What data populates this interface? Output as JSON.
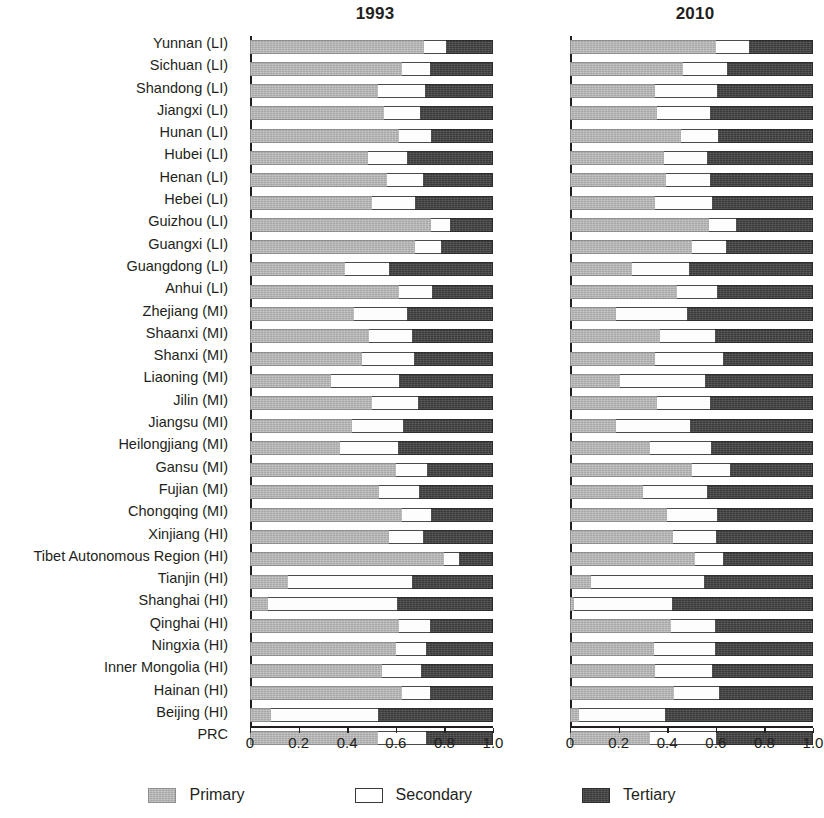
{
  "chart_data": {
    "type": "bar",
    "subtype": "stacked-horizontal-100pct",
    "panels": [
      {
        "title": "1993"
      },
      {
        "title": "2010"
      }
    ],
    "series": [
      {
        "name": "Primary",
        "color": "#a8a8a8"
      },
      {
        "name": "Secondary",
        "color": "#ffffff"
      },
      {
        "name": "Tertiary",
        "color": "#3a3a3a"
      }
    ],
    "categories": [
      "Yunnan (LI)",
      "Sichuan (LI)",
      "Shandong (LI)",
      "Jiangxi (LI)",
      "Hunan (LI)",
      "Hubei (LI)",
      "Henan (LI)",
      "Hebei (LI)",
      "Guizhou (LI)",
      "Guangxi (LI)",
      "Guangdong (LI)",
      "Anhui (LI)",
      "Zhejiang (MI)",
      "Shaanxi (MI)",
      "Shanxi (MI)",
      "Liaoning (MI)",
      "Jilin (MI)",
      "Jiangsu (MI)",
      "Heilongjiang (MI)",
      "Gansu (MI)",
      "Fujian (MI)",
      "Chongqing (MI)",
      "Xinjiang (HI)",
      "Tibet Autonomous Region (HI)",
      "Tianjin (HI)",
      "Shanghai (HI)",
      "Qinghai (HI)",
      "Ningxia (HI)",
      "Inner Mongolia (HI)",
      "Hainan (HI)",
      "Beijing (HI)",
      "PRC"
    ],
    "values_1993": [
      {
        "primary": 0.715,
        "secondary": 0.09,
        "tertiary": 0.195
      },
      {
        "primary": 0.625,
        "secondary": 0.115,
        "tertiary": 0.26
      },
      {
        "primary": 0.525,
        "secondary": 0.195,
        "tertiary": 0.28
      },
      {
        "primary": 0.55,
        "secondary": 0.15,
        "tertiary": 0.3
      },
      {
        "primary": 0.615,
        "secondary": 0.13,
        "tertiary": 0.255
      },
      {
        "primary": 0.485,
        "secondary": 0.16,
        "tertiary": 0.355
      },
      {
        "primary": 0.565,
        "secondary": 0.145,
        "tertiary": 0.29
      },
      {
        "primary": 0.5,
        "secondary": 0.18,
        "tertiary": 0.32
      },
      {
        "primary": 0.745,
        "secondary": 0.08,
        "tertiary": 0.175
      },
      {
        "primary": 0.68,
        "secondary": 0.105,
        "tertiary": 0.215
      },
      {
        "primary": 0.39,
        "secondary": 0.18,
        "tertiary": 0.43
      },
      {
        "primary": 0.615,
        "secondary": 0.135,
        "tertiary": 0.25
      },
      {
        "primary": 0.43,
        "secondary": 0.215,
        "tertiary": 0.355
      },
      {
        "primary": 0.49,
        "secondary": 0.175,
        "tertiary": 0.335
      },
      {
        "primary": 0.46,
        "secondary": 0.215,
        "tertiary": 0.325
      },
      {
        "primary": 0.335,
        "secondary": 0.28,
        "tertiary": 0.385
      },
      {
        "primary": 0.5,
        "secondary": 0.19,
        "tertiary": 0.31
      },
      {
        "primary": 0.42,
        "secondary": 0.21,
        "tertiary": 0.37
      },
      {
        "primary": 0.37,
        "secondary": 0.24,
        "tertiary": 0.39
      },
      {
        "primary": 0.6,
        "secondary": 0.13,
        "tertiary": 0.27
      },
      {
        "primary": 0.53,
        "secondary": 0.165,
        "tertiary": 0.305
      },
      {
        "primary": 0.625,
        "secondary": 0.12,
        "tertiary": 0.255
      },
      {
        "primary": 0.57,
        "secondary": 0.14,
        "tertiary": 0.29
      },
      {
        "primary": 0.8,
        "secondary": 0.06,
        "tertiary": 0.14
      },
      {
        "primary": 0.155,
        "secondary": 0.51,
        "tertiary": 0.335
      },
      {
        "primary": 0.075,
        "secondary": 0.53,
        "tertiary": 0.395
      },
      {
        "primary": 0.615,
        "secondary": 0.125,
        "tertiary": 0.26
      },
      {
        "primary": 0.6,
        "secondary": 0.125,
        "tertiary": 0.275
      },
      {
        "primary": 0.545,
        "secondary": 0.16,
        "tertiary": 0.295
      },
      {
        "primary": 0.625,
        "secondary": 0.115,
        "tertiary": 0.26
      },
      {
        "primary": 0.085,
        "secondary": 0.44,
        "tertiary": 0.475
      },
      {
        "primary": 0.525,
        "secondary": 0.2,
        "tertiary": 0.275
      }
    ],
    "values_2010": [
      {
        "primary": 0.6,
        "secondary": 0.135,
        "tertiary": 0.265
      },
      {
        "primary": 0.465,
        "secondary": 0.18,
        "tertiary": 0.355
      },
      {
        "primary": 0.35,
        "secondary": 0.255,
        "tertiary": 0.395
      },
      {
        "primary": 0.36,
        "secondary": 0.215,
        "tertiary": 0.425
      },
      {
        "primary": 0.455,
        "secondary": 0.155,
        "tertiary": 0.39
      },
      {
        "primary": 0.385,
        "secondary": 0.18,
        "tertiary": 0.435
      },
      {
        "primary": 0.395,
        "secondary": 0.18,
        "tertiary": 0.425
      },
      {
        "primary": 0.35,
        "secondary": 0.235,
        "tertiary": 0.415
      },
      {
        "primary": 0.57,
        "secondary": 0.115,
        "tertiary": 0.315
      },
      {
        "primary": 0.5,
        "secondary": 0.14,
        "tertiary": 0.36
      },
      {
        "primary": 0.255,
        "secondary": 0.235,
        "tertiary": 0.51
      },
      {
        "primary": 0.44,
        "secondary": 0.165,
        "tertiary": 0.395
      },
      {
        "primary": 0.19,
        "secondary": 0.29,
        "tertiary": 0.52
      },
      {
        "primary": 0.37,
        "secondary": 0.225,
        "tertiary": 0.405
      },
      {
        "primary": 0.35,
        "secondary": 0.28,
        "tertiary": 0.37
      },
      {
        "primary": 0.205,
        "secondary": 0.35,
        "tertiary": 0.445
      },
      {
        "primary": 0.36,
        "secondary": 0.215,
        "tertiary": 0.425
      },
      {
        "primary": 0.19,
        "secondary": 0.305,
        "tertiary": 0.505
      },
      {
        "primary": 0.33,
        "secondary": 0.25,
        "tertiary": 0.42
      },
      {
        "primary": 0.5,
        "secondary": 0.16,
        "tertiary": 0.34
      },
      {
        "primary": 0.3,
        "secondary": 0.265,
        "tertiary": 0.435
      },
      {
        "primary": 0.4,
        "secondary": 0.205,
        "tertiary": 0.395
      },
      {
        "primary": 0.425,
        "secondary": 0.175,
        "tertiary": 0.4
      },
      {
        "primary": 0.515,
        "secondary": 0.115,
        "tertiary": 0.37
      },
      {
        "primary": 0.085,
        "secondary": 0.465,
        "tertiary": 0.45
      },
      {
        "primary": 0.015,
        "secondary": 0.405,
        "tertiary": 0.58
      },
      {
        "primary": 0.415,
        "secondary": 0.18,
        "tertiary": 0.405
      },
      {
        "primary": 0.345,
        "secondary": 0.25,
        "tertiary": 0.405
      },
      {
        "primary": 0.35,
        "secondary": 0.235,
        "tertiary": 0.415
      },
      {
        "primary": 0.43,
        "secondary": 0.185,
        "tertiary": 0.385
      },
      {
        "primary": 0.035,
        "secondary": 0.355,
        "tertiary": 0.61
      },
      {
        "primary": 0.33,
        "secondary": 0.27,
        "tertiary": 0.4
      }
    ],
    "xlabel": "",
    "ylabel": "",
    "xlim": [
      0,
      1.0
    ],
    "xticks": [
      "0",
      "0.2",
      "0.4",
      "0.6",
      "0.8",
      "1.0"
    ],
    "xtick_values": [
      0,
      0.2,
      0.4,
      0.6,
      0.8,
      1.0
    ],
    "grid": false,
    "legend_position": "bottom"
  },
  "legend": {
    "items": [
      {
        "label": "Primary"
      },
      {
        "label": "Secondary"
      },
      {
        "label": "Tertiary"
      }
    ]
  }
}
